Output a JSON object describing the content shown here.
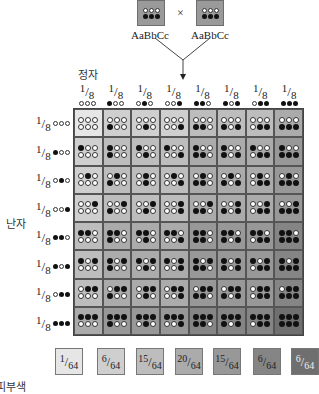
{
  "parents": {
    "left": {
      "genotype": "AaBbCc",
      "top_dots": "www",
      "bottom_dots": "bbb"
    },
    "right": {
      "genotype": "AaBbCc",
      "top_dots": "www",
      "bottom_dots": "bbb"
    },
    "cross_symbol": "×"
  },
  "labels": {
    "sperm": "정자",
    "egg": "난자",
    "legend_title_partial": ":",
    "legend_subtitle_partial": "피부색"
  },
  "gamete_fraction": {
    "numerator": "1",
    "denominator": "8"
  },
  "columns": [
    "www",
    "bww",
    "wbw",
    "wwb",
    "bbw",
    "bwb",
    "wbb",
    "bbb"
  ],
  "rows": [
    "www",
    "bww",
    "wbw",
    "wwb",
    "bbw",
    "bwb",
    "wbb",
    "bbb"
  ],
  "shade_by_dark_count": [
    "#e6e6e6",
    "#cfcfcf",
    "#bdbdbd",
    "#ababab",
    "#989898",
    "#858585",
    "#6f6f6f"
  ],
  "legend": [
    {
      "numerator": "1",
      "denominator": "64",
      "color": "#e6e6e6",
      "text_color": "#222"
    },
    {
      "numerator": "6",
      "denominator": "64",
      "color": "#cfcfcf",
      "text_color": "#222"
    },
    {
      "numerator": "15",
      "denominator": "64",
      "color": "#bdbdbd",
      "text_color": "#222"
    },
    {
      "numerator": "20",
      "denominator": "64",
      "color": "#ababab",
      "text_color": "#222"
    },
    {
      "numerator": "15",
      "denominator": "64",
      "color": "#989898",
      "text_color": "#222"
    },
    {
      "numerator": "6",
      "denominator": "64",
      "color": "#858585",
      "text_color": "#222"
    },
    {
      "numerator": "6",
      "denominator": "64",
      "color": "#6f6f6f",
      "text_color": "#f0f0f0"
    }
  ]
}
